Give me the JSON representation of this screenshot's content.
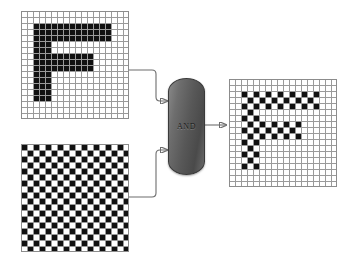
{
  "diagram": {
    "operator_label": "AND",
    "colors": {
      "on_cell": "#111111",
      "off_cell": "#ffffff",
      "grid_line": "#9a9a9a",
      "panel_border": "#8c8c8c",
      "wire": "#6d6d6d",
      "node_dark": "#4a4a4a",
      "node_light": "#8a8a8a"
    },
    "nodes": {
      "input_a": {
        "name": "letter-f-bitmap",
        "rows": 18,
        "cols": 18,
        "cells": [
          "000000000000000000",
          "000000000000000000",
          "001111111111111000",
          "001111111111111000",
          "001111111111111000",
          "001110000000000000",
          "001110000000000000",
          "001111111111000000",
          "001111111111000000",
          "001111111111000000",
          "001110000000000000",
          "001110000000000000",
          "001110000000000000",
          "001110000000000000",
          "001110000000000000",
          "000000000000000000",
          "000000000000000000",
          "000000000000000000"
        ]
      },
      "input_b": {
        "name": "checkerboard-mask",
        "rows": 18,
        "cols": 18,
        "pattern": "checkerboard",
        "phase": 0
      },
      "output": {
        "name": "and-result-bitmap",
        "rows": 18,
        "cols": 18,
        "operation": "and"
      }
    },
    "wires": [
      {
        "name": "wire-input-a-to-and",
        "from": "input_a",
        "to": "operator"
      },
      {
        "name": "wire-input-b-to-and",
        "from": "input_b",
        "to": "operator"
      },
      {
        "name": "wire-and-to-output",
        "from": "operator",
        "to": "output"
      }
    ]
  }
}
